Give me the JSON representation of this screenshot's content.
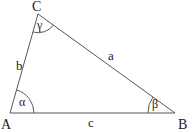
{
  "diagram": {
    "type": "triangle",
    "stroke_color": "#555555",
    "text_color": "#222222",
    "vertices": [
      {
        "id": "A",
        "label": "A",
        "x": 10,
        "y": 113
      },
      {
        "id": "B",
        "label": "B",
        "x": 175,
        "y": 113
      },
      {
        "id": "C",
        "label": "C",
        "x": 38,
        "y": 14
      }
    ],
    "sides": [
      {
        "id": "a",
        "label": "a",
        "between": [
          "B",
          "C"
        ]
      },
      {
        "id": "b",
        "label": "b",
        "between": [
          "A",
          "C"
        ]
      },
      {
        "id": "c",
        "label": "c",
        "between": [
          "A",
          "B"
        ]
      }
    ],
    "angles": [
      {
        "id": "alpha",
        "label": "α",
        "vertex": "A"
      },
      {
        "id": "beta",
        "label": "β",
        "vertex": "B"
      },
      {
        "id": "gamma",
        "label": "γ",
        "vertex": "C"
      }
    ]
  }
}
